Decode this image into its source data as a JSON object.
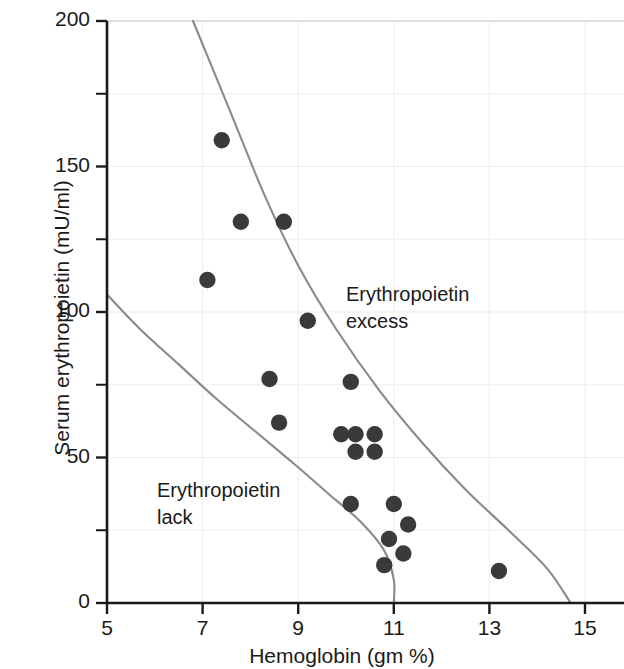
{
  "chart_data": {
    "type": "scatter",
    "title": "",
    "xlabel": "Hemoglobin (gm %)",
    "ylabel": "Serum erythropoietin (mU/ml)",
    "xlim": [
      5,
      15
    ],
    "ylim": [
      0,
      200
    ],
    "xticks": [
      5,
      7,
      9,
      11,
      13,
      15
    ],
    "yticks": [
      0,
      50,
      100,
      150,
      200
    ],
    "y_minor_ticks": [
      25,
      75,
      125,
      175
    ],
    "grid": true,
    "legend": null,
    "point_color": "#3a3a3a",
    "curve_color": "#8a8a8a",
    "axis_color": "#1a1a1a",
    "points": [
      {
        "x": 7.4,
        "y": 159
      },
      {
        "x": 7.8,
        "y": 131
      },
      {
        "x": 8.7,
        "y": 131
      },
      {
        "x": 7.1,
        "y": 111
      },
      {
        "x": 9.2,
        "y": 97
      },
      {
        "x": 8.4,
        "y": 77
      },
      {
        "x": 10.1,
        "y": 76
      },
      {
        "x": 8.6,
        "y": 62
      },
      {
        "x": 9.9,
        "y": 58
      },
      {
        "x": 10.2,
        "y": 58
      },
      {
        "x": 10.6,
        "y": 58
      },
      {
        "x": 10.2,
        "y": 52
      },
      {
        "x": 10.6,
        "y": 52
      },
      {
        "x": 10.1,
        "y": 34
      },
      {
        "x": 11.0,
        "y": 34
      },
      {
        "x": 11.3,
        "y": 27
      },
      {
        "x": 10.9,
        "y": 22
      },
      {
        "x": 11.2,
        "y": 17
      },
      {
        "x": 10.8,
        "y": 13
      },
      {
        "x": 13.2,
        "y": 11
      }
    ],
    "curves": [
      {
        "name": "upper-boundary",
        "description": "Upper limit of normal erythropoietin response",
        "path": [
          {
            "x": 6.8,
            "y": 200
          },
          {
            "x": 7.6,
            "y": 168
          },
          {
            "x": 8.3,
            "y": 140
          },
          {
            "x": 9.0,
            "y": 116
          },
          {
            "x": 9.8,
            "y": 94
          },
          {
            "x": 10.7,
            "y": 73
          },
          {
            "x": 11.6,
            "y": 55
          },
          {
            "x": 12.5,
            "y": 39
          },
          {
            "x": 13.4,
            "y": 25
          },
          {
            "x": 14.2,
            "y": 12
          },
          {
            "x": 14.7,
            "y": 0
          }
        ]
      },
      {
        "name": "lower-boundary",
        "description": "Lower limit of normal erythropoietin response",
        "path": [
          {
            "x": 5.0,
            "y": 106
          },
          {
            "x": 5.7,
            "y": 94
          },
          {
            "x": 6.5,
            "y": 82
          },
          {
            "x": 7.3,
            "y": 70
          },
          {
            "x": 8.1,
            "y": 59
          },
          {
            "x": 8.9,
            "y": 48
          },
          {
            "x": 9.6,
            "y": 38
          },
          {
            "x": 10.3,
            "y": 28
          },
          {
            "x": 10.8,
            "y": 18
          },
          {
            "x": 11.0,
            "y": 8
          },
          {
            "x": 11.0,
            "y": 0
          }
        ]
      }
    ],
    "annotations": [
      {
        "name": "erythropoietin-excess",
        "text": "Erythropoietin\nexcess",
        "x": 10.0,
        "y": 108
      },
      {
        "name": "erythropoietin-lack",
        "text": "Erythropoietin\nlack",
        "x": 6.05,
        "y": 41
      }
    ]
  },
  "axes": {
    "x_title": "Hemoglobin (gm %)",
    "y_title": "Serum erythropoietin (mU/ml)",
    "x_tick_labels": [
      "5",
      "7",
      "9",
      "11",
      "13",
      "15"
    ],
    "y_tick_labels": [
      "0",
      "50",
      "100",
      "150",
      "200"
    ]
  },
  "annotations": {
    "excess_line1": "Erythropoietin",
    "excess_line2": "excess",
    "lack_line1": "Erythropoietin",
    "lack_line2": "lack"
  }
}
